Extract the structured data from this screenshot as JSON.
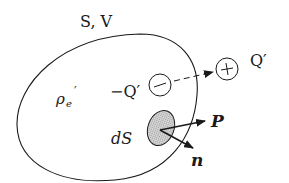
{
  "diagram": {
    "type": "physics-region-polarization",
    "region_label": "S, V",
    "charge_density_label": "ρe′",
    "charge_density_base": "ρ",
    "charge_density_sub": "e",
    "charge_density_prime": "′",
    "negative_charge_label": "−Q′",
    "positive_charge_label": "Q′",
    "negative_symbol": "−",
    "positive_symbol": "+",
    "surface_element_label": "dS",
    "polarization_label": "P",
    "normal_label": "n",
    "colors": {
      "stroke": "#1a1a1a",
      "surface_element_fill": "#c8c8c8",
      "background": "#ffffff"
    }
  }
}
